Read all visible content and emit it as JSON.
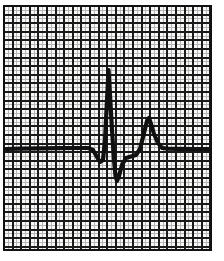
{
  "figure": {
    "name": "ecg-strip",
    "title": "Electrocardiogram tracing on ECG graph paper",
    "caption": "",
    "background_color": "#ffffff"
  },
  "chart_data": {
    "type": "line",
    "title": "Electrocardiogram tracing on ECG graph paper",
    "subtitle": "",
    "xlabel": "",
    "ylabel": "",
    "grid": "on",
    "legend": "none",
    "series": [
      {
        "name": "ECG lead trace",
        "color": "#101010",
        "line_width_px": 4.2,
        "points": [
          [
            6,
            149
          ],
          [
            20,
            148.6
          ],
          [
            40,
            148.4
          ],
          [
            60,
            148.2
          ],
          [
            78,
            148.0
          ],
          [
            88,
            148.0
          ],
          [
            93,
            150.0
          ],
          [
            97,
            157.0
          ],
          [
            100,
            162.0
          ],
          [
            103,
            160.0
          ],
          [
            105,
            140.0
          ],
          [
            107,
            100.0
          ],
          [
            108.5,
            70.0
          ],
          [
            110,
            95.0
          ],
          [
            112,
            130.0
          ],
          [
            114,
            160.0
          ],
          [
            115.5,
            176.0
          ],
          [
            117,
            181.0
          ],
          [
            119,
            176.0
          ],
          [
            122,
            165.0
          ],
          [
            126,
            158.0
          ],
          [
            131,
            156.5
          ],
          [
            136,
            155.0
          ],
          [
            140,
            149.0
          ],
          [
            144,
            133.0
          ],
          [
            147,
            121.0
          ],
          [
            149,
            118.0
          ],
          [
            151,
            124.0
          ],
          [
            154,
            134.0
          ],
          [
            158,
            143.0
          ],
          [
            162,
            148.0
          ],
          [
            168,
            148.6
          ],
          [
            180,
            148.8
          ],
          [
            196,
            149.0
          ],
          [
            209,
            149.2
          ]
        ]
      }
    ],
    "annotations": [
      {
        "label": "P wave",
        "x": 90,
        "y": 147
      },
      {
        "label": "Q wave",
        "x": 100,
        "y": 162
      },
      {
        "label": "R wave",
        "x": 108.5,
        "y": 70
      },
      {
        "label": "S wave",
        "x": 117,
        "y": 181
      },
      {
        "label": "ST segment",
        "x": 131,
        "y": 156
      },
      {
        "label": "T wave",
        "x": 149,
        "y": 118
      }
    ],
    "axis": {
      "x_range_px": [
        4,
        211
      ],
      "y_range_px": [
        6,
        250
      ],
      "baseline_y_px": 148.6
    }
  },
  "grid": {
    "name": "ecg-graph-paper",
    "left_px": 4,
    "top_px": 6,
    "right_px": 211,
    "bottom_px": 250,
    "minor_spacing_px": 4.3,
    "major_every": 2,
    "minor_color": "#b5b5b5",
    "major_color": "#1a1a1a",
    "minor_width_px": 1.0,
    "major_width_px": 1.9,
    "border_color": "#111111",
    "border_width_px": 2.0,
    "paper_color": "#f7f7f5"
  }
}
